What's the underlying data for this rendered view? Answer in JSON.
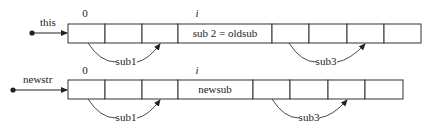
{
  "diagram": {
    "top": {
      "pointer_label": "this",
      "index_start": "0",
      "index_i": "i",
      "middle_cell": "sub 2 = oldsub",
      "arc_left_label": "sub1",
      "arc_right_label": "sub3"
    },
    "bottom": {
      "pointer_label": "newstr",
      "index_start": "0",
      "index_i": "i",
      "middle_cell": "newsub",
      "arc_left_label": "sub1",
      "arc_right_label": "sub3"
    }
  }
}
